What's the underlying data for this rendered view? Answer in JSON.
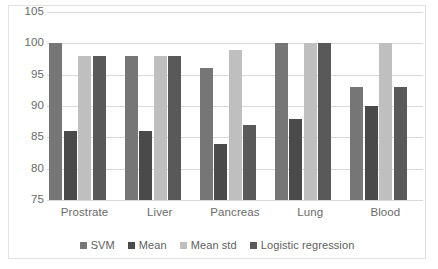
{
  "chart_data": {
    "type": "bar",
    "title": "",
    "xlabel": "",
    "ylabel": "",
    "ylim": [
      75,
      105
    ],
    "ytick_step": 5,
    "yticks": [
      105,
      100,
      95,
      90,
      85,
      80,
      75
    ],
    "grid": true,
    "legend_position": "bottom",
    "categories": [
      "Prostrate",
      "Liver",
      "Pancreas",
      "Lung",
      "Blood"
    ],
    "series": [
      {
        "name": "SVM",
        "color": "#767676",
        "values": [
          100,
          98,
          96,
          100,
          93
        ]
      },
      {
        "name": "Mean",
        "color": "#4a4a4a",
        "values": [
          86,
          86,
          84,
          88,
          90
        ]
      },
      {
        "name": "Mean std",
        "color": "#bfbfbf",
        "values": [
          98,
          98,
          99,
          100,
          100
        ]
      },
      {
        "name": "Logistic regression",
        "color": "#595959",
        "values": [
          98,
          98,
          87,
          100,
          93
        ]
      }
    ]
  },
  "axis": {
    "y_tick_labels": [
      "105",
      "100",
      "95",
      "90",
      "85",
      "80",
      "75"
    ]
  },
  "legend": {
    "items": [
      {
        "label": "SVM",
        "color": "#767676"
      },
      {
        "label": "Mean",
        "color": "#4a4a4a"
      },
      {
        "label": "Mean std",
        "color": "#bfbfbf"
      },
      {
        "label": "Logistic regression",
        "color": "#595959"
      }
    ]
  },
  "colors": {
    "background": "#ffffff",
    "frame": "#e2e2e2",
    "gridline": "#d9d9d9",
    "tick_text": "#6a6a6a",
    "legend_text": "#5e5e5e"
  }
}
